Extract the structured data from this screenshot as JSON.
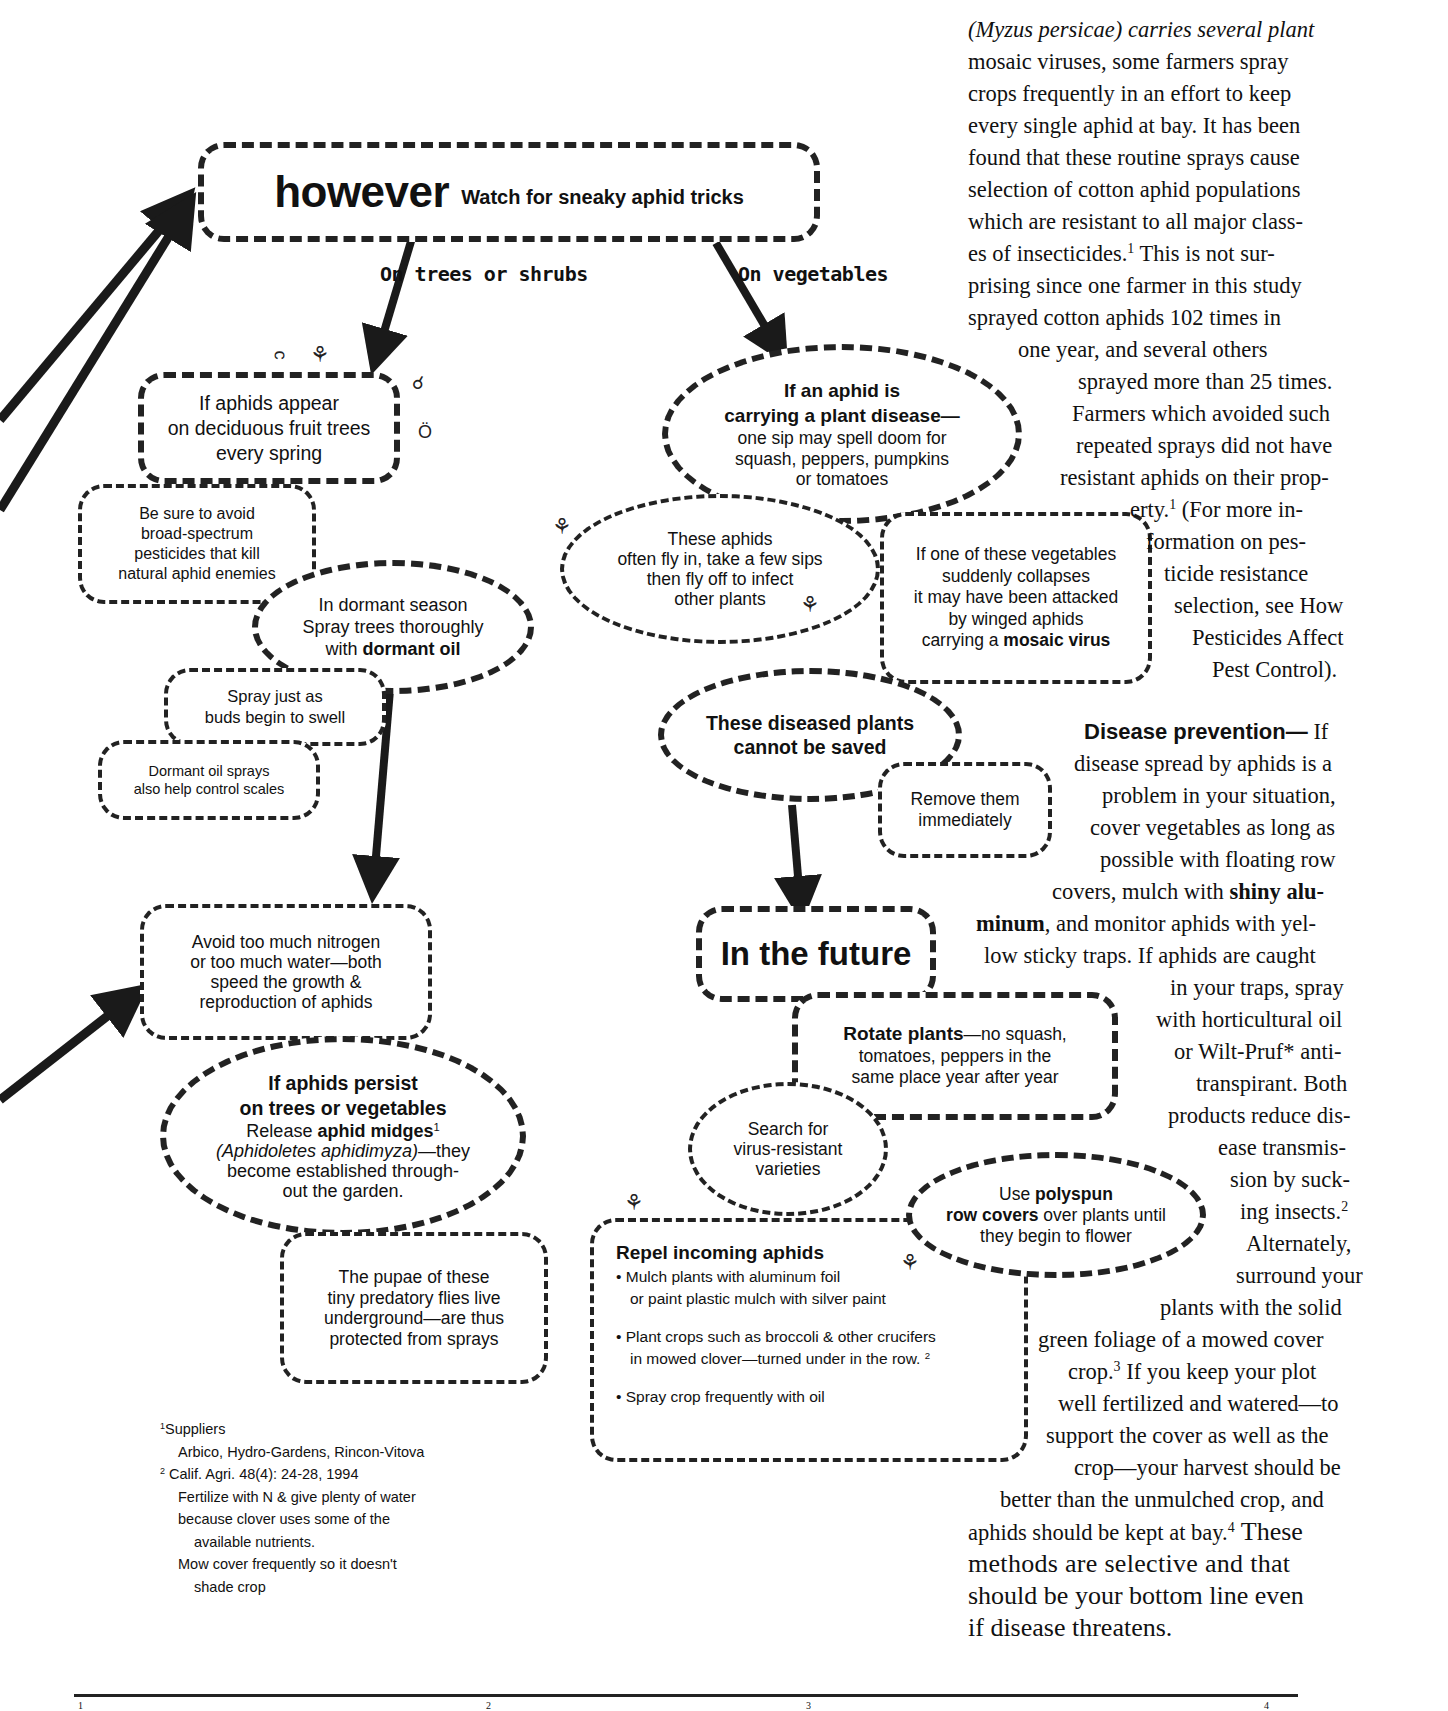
{
  "diagram": {
    "header": {
      "title": "however",
      "subtitle": "Watch for sneaky aphid tricks"
    },
    "branches": {
      "trees": "On trees or shrubs",
      "vegetables": "On vegetables"
    },
    "trees_column": {
      "appear": [
        "If aphids appear",
        "on deciduous fruit trees",
        "every spring"
      ],
      "avoid_broad": [
        "Be sure to avoid",
        "broad-spectrum",
        "pesticides that kill",
        "natural aphid enemies"
      ],
      "dormant": {
        "line1": "In dormant season",
        "line2": "Spray trees thoroughly",
        "line3_prefix": "with ",
        "line3_bold": "dormant oil"
      },
      "spray_timing": [
        "Spray just as",
        "buds begin to swell"
      ],
      "scales": [
        "Dormant oil sprays",
        "also help control scales"
      ],
      "nitrogen": [
        "Avoid too much nitrogen",
        "or too much water—both",
        "speed the growth &",
        "reproduction of aphids"
      ],
      "persist": {
        "title1": "If aphids persist",
        "title2": "on trees or vegetables",
        "release_prefix": "Release ",
        "release_bold": "aphid midges",
        "release_sup": "1",
        "species": "(Aphidoletes aphidimyza)",
        "species_suffix": "—they",
        "line4": "become established through-",
        "line5": "out the garden."
      },
      "pupae": [
        "The pupae of these",
        "tiny predatory flies live",
        "underground—are thus",
        "protected from sprays"
      ]
    },
    "vegetables_column": {
      "disease": {
        "title1": "If an aphid is",
        "title2": "carrying a plant disease—",
        "line3": "one sip may spell doom for",
        "line4": "squash, peppers, pumpkins",
        "line5": "or tomatoes"
      },
      "fly_in": [
        "These aphids",
        "often fly in, take a few sips",
        "then fly off to infect",
        "other plants"
      ],
      "collapse": {
        "line1": "If one of these vegetables",
        "line2": "suddenly collapses",
        "line3": "it may have been attacked",
        "line4": "by winged aphids",
        "line5_prefix": "carrying a ",
        "line5_bold": "mosaic virus"
      },
      "cannot_save": [
        "These diseased plants",
        "cannot be saved"
      ],
      "remove": [
        "Remove them",
        "immediately"
      ],
      "future": "In the future",
      "rotate": {
        "bold": "Rotate plants",
        "rest1": "—no squash,",
        "line2": "tomatoes, peppers in the",
        "line3": "same place year after year"
      },
      "search": [
        "Search for",
        "virus-resistant",
        "varieties"
      ],
      "polyspun": {
        "prefix": "Use ",
        "bold1": "polyspun",
        "bold2": "row covers",
        "rest2": " over plants until",
        "line3": "they begin to flower"
      },
      "repel": {
        "title": "Repel incoming aphids",
        "bullets": [
          [
            "• Mulch plants with aluminum foil",
            "or paint plastic mulch with silver paint"
          ],
          [
            "• Plant crops such as broccoli & other crucifers",
            "in mowed clover—turned under in the row."
          ],
          [
            "• Spray crop frequently with oil"
          ]
        ],
        "bullet2_sup": "2"
      }
    },
    "footnotes": {
      "fn1_mark": "1",
      "fn1_title": "Suppliers",
      "fn1_body": "Arbico, Hydro-Gardens, Rincon-Vitova",
      "fn2_mark": "2",
      "fn2_lines": [
        "Calif. Agri. 48(4): 24-28, 1994",
        "Fertilize with N & give plenty of water",
        "because clover uses some of the",
        "available nutrients.",
        "Mow cover frequently so it doesn't",
        "shade crop"
      ]
    }
  },
  "body_text": {
    "column_lines": [
      "(Myzus persicae) carries several plant",
      "mosaic viruses, some farmers spray",
      "crops frequently in an effort to keep",
      "every single aphid at bay.  It has been",
      "found that these routine sprays cause",
      "selection of cotton aphid populations",
      "which are  resistant  to all major class-",
      "es of insecticides.",
      "prising since one farmer in this study",
      "sprayed cotton aphids 102 times in",
      "one  year,  and  several  others",
      "sprayed more than 25 times.",
      "Farmers which avoided such",
      "repeated sprays did not have",
      "resistant aphids on their prop-",
      "erty.",
      "formation on pes-",
      "ticide resistance",
      "selection, see How",
      "Pesticides Affect",
      "Pest Control)."
    ],
    "line8_tail": " This is not sur-",
    "line16_tail": " (For more in-",
    "sup1": "1",
    "disease_prevention": {
      "heading": "Disease prevention—",
      "heading_tail": " If",
      "lines": [
        "disease spread by aphids is a",
        "problem in your situation,",
        "cover vegetables as long as",
        "possible with floating row",
        "covers, mulch with ",
        "minum",
        "low sticky traps.  If aphids are caught",
        "in your traps, spray",
        "with horticultural oil",
        "or Wilt-Pruf* anti-",
        "transpirant.  Both",
        "products reduce dis-",
        "ease transmis-",
        "sion by suck-",
        "ing insects.",
        "Alternately,",
        "surround your",
        "plants with the solid",
        "green  foliage of a mowed cover",
        "crop.",
        "well fertilized and watered—to",
        "support the cover as well as the",
        "crop—your harvest should be",
        "better than the unmulched crop, and",
        "aphids should be kept at bay."
      ],
      "shiny_alu": "shiny alu-",
      "minum_tail": ", and monitor aphids with  yel-",
      "sup_insects": "2",
      "crop_sup": "3",
      "crop_tail": "  If you keep your plot",
      "bay_sup": "4",
      "bay_tail": "  These",
      "closing_lines": [
        "methods are selective and that",
        "should be your bottom line even",
        "if disease threatens."
      ]
    },
    "bottom_marks": [
      "1",
      "2",
      "3",
      "4"
    ]
  },
  "colors": {
    "ink": "#111111",
    "paper": "#ffffff",
    "arrow": "#1a1a1a"
  }
}
